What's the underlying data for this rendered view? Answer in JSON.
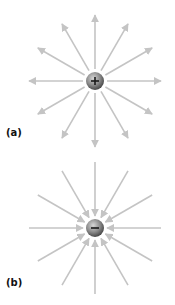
{
  "panels": [
    {
      "id": "a",
      "label": "(a)",
      "charge": "positive",
      "charge_symbol": "+",
      "field_direction": "outward",
      "center": [
        95,
        81
      ],
      "line_count": 12,
      "label_pos": [
        6,
        127
      ]
    },
    {
      "id": "b",
      "label": "(b)",
      "charge": "negative",
      "charge_symbol": "−",
      "field_direction": "inward",
      "center": [
        95,
        228
      ],
      "line_count": 12,
      "label_pos": [
        6,
        277
      ]
    }
  ],
  "colors": {
    "field_line": "#c4c4c4",
    "sphere_light": "#c9c9c9",
    "sphere_dark": "#4a4a4a",
    "symbol": "#1a1a1a"
  }
}
